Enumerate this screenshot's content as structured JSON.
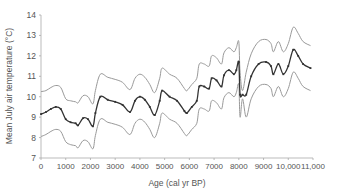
{
  "chart_data": {
    "type": "line",
    "title": "",
    "xlabel": "Age (cal yr BP)",
    "ylabel": "Mean July air temperature (°C)",
    "xlim": [
      0,
      11000
    ],
    "ylim": [
      7,
      14
    ],
    "xticks": [
      0,
      1000,
      2000,
      3000,
      4000,
      5000,
      6000,
      7000,
      8000,
      9000,
      10000,
      11000
    ],
    "xtick_labels": [
      "0",
      "1000",
      "2000",
      "3000",
      "4000",
      "5000",
      "6000",
      "7000",
      "8000",
      "9000",
      "10,000",
      "11,000"
    ],
    "yticks": [
      7,
      8,
      9,
      10,
      11,
      12,
      13,
      14
    ],
    "ytick_labels": [
      "7",
      "8",
      "9",
      "10",
      "11",
      "12",
      "13",
      "14"
    ],
    "grid": false,
    "legend": null,
    "x": [
      0,
      200,
      400,
      600,
      800,
      1000,
      1200,
      1400,
      1500,
      1700,
      1900,
      2100,
      2200,
      2400,
      2700,
      3000,
      3300,
      3600,
      3800,
      4000,
      4200,
      4400,
      4600,
      4800,
      4900,
      5200,
      5500,
      5800,
      5900,
      6100,
      6300,
      6400,
      6600,
      6800,
      6900,
      7100,
      7300,
      7400,
      7600,
      7800,
      7900,
      8000,
      8050,
      8150,
      8300,
      8500,
      8800,
      9100,
      9300,
      9400,
      9600,
      9800,
      10000,
      10200,
      10400,
      10600,
      10900
    ],
    "series": [
      {
        "name": "Mean",
        "color": "#333333",
        "markers": true,
        "values": [
          9.15,
          9.25,
          9.4,
          9.5,
          9.4,
          8.9,
          8.75,
          8.7,
          8.6,
          8.95,
          8.9,
          8.55,
          9.2,
          10.0,
          9.85,
          9.75,
          9.6,
          9.25,
          9.8,
          10.0,
          9.85,
          9.5,
          9.1,
          9.8,
          10.3,
          10.0,
          9.8,
          9.3,
          9.2,
          9.5,
          9.8,
          10.5,
          10.5,
          10.4,
          10.9,
          10.8,
          10.5,
          11.05,
          11.3,
          11.1,
          11.3,
          11.7,
          10.1,
          10.1,
          10.1,
          11.0,
          11.6,
          11.7,
          11.5,
          11.1,
          11.6,
          11.1,
          11.5,
          12.3,
          12.0,
          11.6,
          11.4
        ]
      },
      {
        "name": "Upper bound",
        "color": "#999999",
        "markers": false,
        "values": [
          10.25,
          10.3,
          10.45,
          10.55,
          10.45,
          9.9,
          9.8,
          9.75,
          9.7,
          10.05,
          10.0,
          9.65,
          10.3,
          11.1,
          10.95,
          10.85,
          10.7,
          10.35,
          10.9,
          11.1,
          10.95,
          10.6,
          10.2,
          10.9,
          11.4,
          11.1,
          10.9,
          10.4,
          10.3,
          10.6,
          10.9,
          11.6,
          11.6,
          11.5,
          12.0,
          11.9,
          11.6,
          12.15,
          12.4,
          12.2,
          12.4,
          12.7,
          11.2,
          10.3,
          11.2,
          12.1,
          12.7,
          12.8,
          12.6,
          12.2,
          12.7,
          12.2,
          12.6,
          13.4,
          13.1,
          12.7,
          12.5
        ]
      },
      {
        "name": "Lower bound",
        "color": "#999999",
        "markers": false,
        "values": [
          8.05,
          8.15,
          8.3,
          8.4,
          8.3,
          7.8,
          7.65,
          7.6,
          7.5,
          7.85,
          7.8,
          7.45,
          8.1,
          8.9,
          8.75,
          8.65,
          8.5,
          8.15,
          8.7,
          8.9,
          8.75,
          8.4,
          8.0,
          8.7,
          9.2,
          8.9,
          8.7,
          8.2,
          8.1,
          8.4,
          8.7,
          9.4,
          9.4,
          9.3,
          9.8,
          9.7,
          9.4,
          9.95,
          10.2,
          10.0,
          10.2,
          10.6,
          9.0,
          9.9,
          9.0,
          9.9,
          10.5,
          10.6,
          10.4,
          10.0,
          10.5,
          10.0,
          10.4,
          11.2,
          10.9,
          10.5,
          10.3
        ]
      }
    ]
  }
}
